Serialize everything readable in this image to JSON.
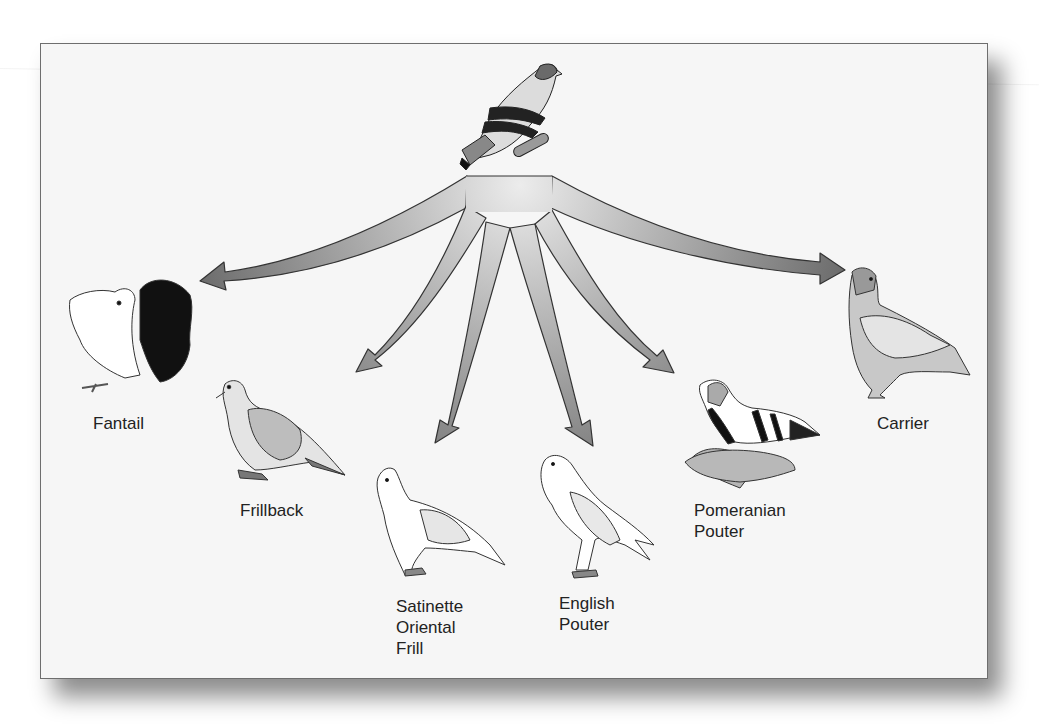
{
  "diagram": {
    "ancestor": {
      "name": "rock-pigeon",
      "icon": "ancestor-pigeon-icon"
    },
    "breeds": [
      {
        "id": "fantail",
        "lines": [
          "Fantail"
        ]
      },
      {
        "id": "frillback",
        "lines": [
          "Frillback"
        ]
      },
      {
        "id": "satinette",
        "lines": [
          "Satinette",
          "Oriental",
          "Frill"
        ]
      },
      {
        "id": "english-pouter",
        "lines": [
          "English",
          "Pouter"
        ]
      },
      {
        "id": "pomeranian-pouter",
        "lines": [
          "Pomeranian",
          "Pouter"
        ]
      },
      {
        "id": "carrier",
        "lines": [
          "Carrier"
        ]
      }
    ],
    "colors": {
      "arrow_light": "#e6e6e6",
      "arrow_dark": "#6f6f6f",
      "outline": "#333333",
      "panel": "#f6f6f6"
    }
  }
}
